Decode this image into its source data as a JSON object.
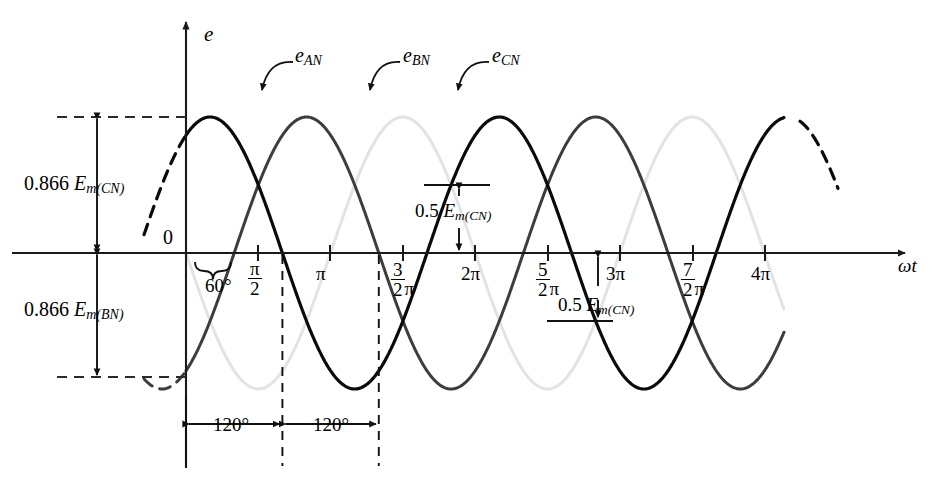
{
  "figure": {
    "type": "line",
    "title": "",
    "axis": {
      "y_label": "e",
      "x_label": "ωt",
      "origin_label": "0"
    },
    "xticks": [
      {
        "id": "pi-over-2",
        "kind": "fraction",
        "num": "π",
        "den": "2",
        "text": "π/2",
        "x_px": 258
      },
      {
        "id": "pi",
        "kind": "plain",
        "text": "π",
        "x_px": 330
      },
      {
        "id": "three-halves-pi",
        "kind": "fraction-pi",
        "num": "3",
        "den": "2",
        "suffix": "π",
        "text": "3π/2",
        "x_px": 403
      },
      {
        "id": "two-pi",
        "kind": "plain",
        "text": "2π",
        "x_px": 475
      },
      {
        "id": "five-halves-pi",
        "kind": "fraction-pi",
        "num": "5",
        "den": "2",
        "suffix": "π",
        "text": "5π/2",
        "x_px": 548
      },
      {
        "id": "three-pi",
        "kind": "plain",
        "text": "3π",
        "x_px": 620
      },
      {
        "id": "seven-halves-pi",
        "kind": "fraction-pi",
        "num": "7",
        "den": "2",
        "suffix": "π",
        "text": "7π/2",
        "x_px": 693
      },
      {
        "id": "four-pi",
        "kind": "plain",
        "text": "4π",
        "x_px": 765
      }
    ],
    "curves": [
      {
        "name": "e_AN",
        "label_base": "e",
        "label_sub": "AN",
        "color": "#3d3d3d",
        "phase_deg": -60,
        "stroke": 3.0
      },
      {
        "name": "e_BN",
        "label_base": "e",
        "label_sub": "BN",
        "color": "#e3e3e3",
        "phase_deg": 180,
        "stroke": 3.0
      },
      {
        "name": "e_CN",
        "label_base": "e",
        "label_sub": "CN",
        "color": "#0a0a0a",
        "phase_deg": 60,
        "stroke": 3.2
      }
    ],
    "annotations": {
      "amplitude_upper": {
        "prefix": "0.866",
        "base": "E",
        "sub": "m(CN)",
        "text": "0.866 E_m(CN)"
      },
      "amplitude_lower": {
        "prefix": "0.866",
        "base": "E",
        "sub": "m(BN)",
        "text": "0.866 E_m(BN)"
      },
      "half_upper": {
        "prefix": "0.5",
        "base": "E",
        "sub": "m(CN)",
        "text": "0.5 E_m(CN)"
      },
      "half_lower": {
        "prefix": "0.5",
        "base": "E",
        "sub": "m(CN)",
        "text": "0.5 E_m(CN)"
      },
      "angle_60": "60°",
      "angle_120_a": "120°",
      "angle_120_b": "120°"
    },
    "geometry": {
      "origin_x": 186,
      "origin_y": 253,
      "px_per_half_pi": 72.3,
      "amplitude_px": 136,
      "x_axis_end": 905,
      "y_axis_top": 22,
      "level_0866_up_y": 117,
      "level_0866_down_y": 377,
      "level_half_y": 185
    },
    "colors": {
      "axis": "#1a1a1a",
      "e_an": "#3d3d3d",
      "e_bn": "#e3e3e3",
      "e_cn": "#0a0a0a",
      "dashed": "#2a2a2a"
    }
  }
}
